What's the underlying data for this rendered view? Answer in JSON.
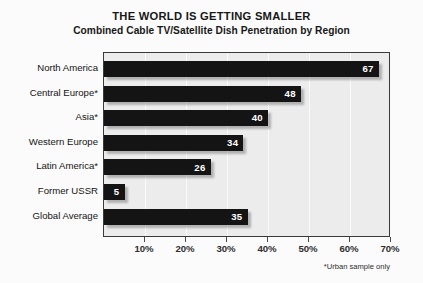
{
  "chart_data": {
    "type": "bar",
    "orientation": "horizontal",
    "title": "THE WORLD IS GETTING SMALLER",
    "subtitle": "Combined Cable TV/Satellite Dish Penetration by Region",
    "categories": [
      "North America",
      "Central Europe*",
      "Asia*",
      "Western Europe",
      "Latin America*",
      "Former USSR",
      "Global Average"
    ],
    "values": [
      67,
      48,
      40,
      34,
      26,
      5,
      35
    ],
    "value_labels": [
      "67",
      "48",
      "40",
      "34",
      "26",
      "5",
      "35"
    ],
    "xlabel": "",
    "ylabel": "",
    "xlim": [
      0,
      70
    ],
    "xtick_values": [
      10,
      20,
      30,
      40,
      50,
      60,
      70
    ],
    "xtick_labels": [
      "10%",
      "20%",
      "30%",
      "40%",
      "50%",
      "60%",
      "70%"
    ],
    "grid": true,
    "grid_axis": "x",
    "legend": false,
    "annotation": "*Urban sample only",
    "bar_color": "#141414",
    "value_label_color": "#ffffff",
    "plot_background": "#ececec",
    "page_background": "#fbfbfb"
  }
}
